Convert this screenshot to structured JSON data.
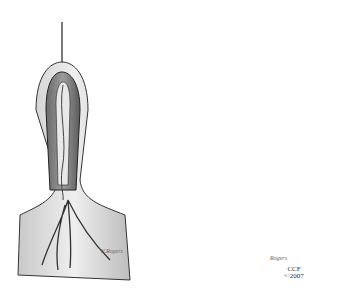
{
  "figure": {
    "panels": [
      {
        "id": "left",
        "description": "Exposed tissue flap with central vessel, before suturing"
      },
      {
        "id": "right",
        "description": "Running suture closure with needle and thread"
      }
    ],
    "signature_left": "W.Rogers",
    "signature_right": "Rogers",
    "credit": {
      "org": "CCF",
      "year": "©2007"
    },
    "colors": {
      "background": "#ffffff",
      "ink": "#222222",
      "shade": "#8a8a8a"
    }
  }
}
